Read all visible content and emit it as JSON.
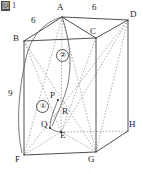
{
  "figure": {
    "tag_char": "図",
    "tag_number": "1",
    "caption_full": "図 1",
    "type": "geometry-solid-diagram",
    "solid": "pentagonal-prism"
  },
  "vertices": [
    {
      "name": "A",
      "label": "A",
      "x": 62,
      "y": 17,
      "label_x": 57,
      "label_y": 6
    },
    {
      "name": "B",
      "label": "B",
      "x": 24,
      "y": 41,
      "label_x": 13,
      "label_y": 36
    },
    {
      "name": "C",
      "label": "C",
      "x": 96,
      "y": 38,
      "label_x": 92,
      "label_y": 28
    },
    {
      "name": "D",
      "label": "D",
      "x": 128,
      "y": 20,
      "label_x": 131,
      "label_y": 12
    },
    {
      "name": "E",
      "label": "E",
      "x": 61,
      "y": 132,
      "label_x": 58,
      "label_y": 133
    },
    {
      "name": "F",
      "label": "F",
      "x": 24,
      "y": 155,
      "label_x": 16,
      "label_y": 156
    },
    {
      "name": "G",
      "label": "G",
      "x": 96,
      "y": 152,
      "label_x": 90,
      "label_y": 156
    },
    {
      "name": "H",
      "label": "H",
      "x": 128,
      "y": 131,
      "label_x": 130,
      "label_y": 122
    },
    {
      "name": "P",
      "label": "P",
      "x": 58,
      "y": 100,
      "label_x": 50,
      "label_y": 93
    },
    {
      "name": "Q",
      "label": "Q",
      "x": 50,
      "y": 128,
      "label_x": 42,
      "label_y": 121
    },
    {
      "name": "R",
      "label": "R",
      "x": 64,
      "y": 114,
      "label_x": 62,
      "label_y": 108
    }
  ],
  "dimensions": [
    {
      "name": "ba-length",
      "value": "6",
      "x": 33,
      "y": 20,
      "edge": "B-A"
    },
    {
      "name": "ad-length",
      "value": "6",
      "x": 93,
      "y": 5,
      "edge": "A-D"
    },
    {
      "name": "bf-length",
      "value": "9",
      "x": 9,
      "y": 93,
      "edge": "B-F"
    }
  ],
  "annotations": [
    {
      "name": "arc-marker-1",
      "label": "①",
      "x": 41,
      "y": 105
    },
    {
      "name": "arc-marker-2",
      "label": "②",
      "x": 61,
      "y": 54
    }
  ],
  "colors": {
    "stroke_solid": "#3a3a3a",
    "stroke_hidden": "#8c8c8c",
    "stroke_arc": "#5a5a5a",
    "text": "#1c1c1c",
    "background": "#ffffff"
  }
}
